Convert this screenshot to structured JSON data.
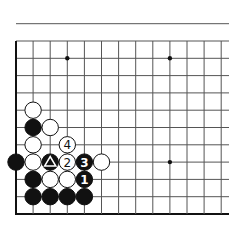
{
  "diagram": {
    "type": "go-board-fragment",
    "corner": "lower-left",
    "grid": {
      "origin_x": 16,
      "bottom_y": 214,
      "spacing_x": 17.1,
      "spacing_y": 17.3,
      "columns": 13,
      "rows": 12,
      "right_extent": 229,
      "top_extent": 13
    },
    "colors": {
      "line": "#555555",
      "edge": "#111111",
      "black_stone": "#111111",
      "white_stone": "#ffffff",
      "stone_outline": "#111111"
    },
    "star_points": [
      {
        "col": 3,
        "row": 9
      },
      {
        "col": 9,
        "row": 9
      },
      {
        "col": 9,
        "row": 3
      }
    ],
    "stones": [
      {
        "color": "white",
        "col": 1,
        "row": 6,
        "label": ""
      },
      {
        "color": "black",
        "col": 1,
        "row": 5,
        "label": ""
      },
      {
        "color": "white",
        "col": 2,
        "row": 5,
        "label": ""
      },
      {
        "color": "white",
        "col": 1,
        "row": 4,
        "label": ""
      },
      {
        "color": "white",
        "col": 3,
        "row": 4,
        "label": "4"
      },
      {
        "color": "black",
        "col": 0,
        "row": 3,
        "label": ""
      },
      {
        "color": "white",
        "col": 1,
        "row": 3,
        "label": ""
      },
      {
        "color": "black",
        "col": 2,
        "row": 3,
        "label": "",
        "marker": "triangle"
      },
      {
        "color": "white",
        "col": 3,
        "row": 3,
        "label": "2"
      },
      {
        "color": "black",
        "col": 4,
        "row": 3,
        "label": "3"
      },
      {
        "color": "white",
        "col": 5,
        "row": 3,
        "label": ""
      },
      {
        "color": "black",
        "col": 1,
        "row": 2,
        "label": ""
      },
      {
        "color": "white",
        "col": 2,
        "row": 2,
        "label": ""
      },
      {
        "color": "white",
        "col": 3,
        "row": 2,
        "label": ""
      },
      {
        "color": "black",
        "col": 4,
        "row": 2,
        "label": "1"
      },
      {
        "color": "black",
        "col": 1,
        "row": 1,
        "label": ""
      },
      {
        "color": "black",
        "col": 2,
        "row": 1,
        "label": ""
      },
      {
        "color": "black",
        "col": 3,
        "row": 1,
        "label": ""
      },
      {
        "color": "black",
        "col": 4,
        "row": 1,
        "label": ""
      }
    ]
  }
}
